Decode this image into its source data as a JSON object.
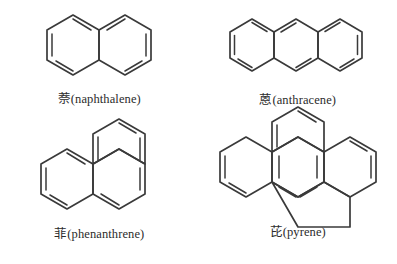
{
  "figure": {
    "background_color": "#ffffff",
    "stroke_color": "#3a3a3a",
    "text_color": "#2b2b2b",
    "cells": [
      {
        "id": "naphthalene",
        "chinese_name": "萘",
        "english_name": "naphthalene",
        "caption": "萘(naphthalene)",
        "ring_count": 4,
        "ring_label": "2",
        "arrangement": "linear fused"
      },
      {
        "id": "anthracene",
        "chinese_name": "蒽",
        "english_name": "anthracene",
        "caption": "蒽(anthracene)",
        "ring_count": 3,
        "ring_label": "3",
        "arrangement": "linear fused"
      },
      {
        "id": "phenanthrene",
        "chinese_name": "菲",
        "english_name": "phenanthrene",
        "caption": "菲(phenanthrene)",
        "ring_count": 3,
        "ring_label": "3",
        "arrangement": "angular"
      },
      {
        "id": "pyrene",
        "chinese_name": "芘",
        "english_name": "pyrene",
        "caption": "芘(pyrene)",
        "ring_count": 4,
        "ring_label": "4",
        "arrangement": "peri-fused"
      }
    ],
    "bottom_clipped_caption": ""
  }
}
